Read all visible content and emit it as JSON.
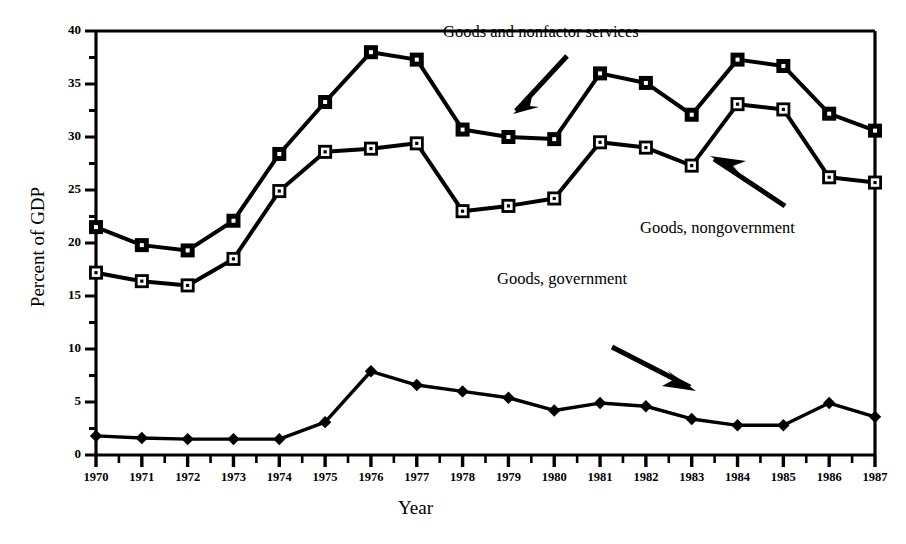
{
  "chart_data": {
    "type": "line",
    "title": "",
    "xlabel": "Year",
    "ylabel": "Percent of GDP",
    "xlim": [
      1970,
      1987
    ],
    "ylim": [
      0,
      40
    ],
    "yticks": [
      0,
      5,
      10,
      15,
      20,
      25,
      30,
      35,
      40
    ],
    "ytick_labels": [
      "0",
      "5",
      "10",
      "15",
      "20",
      "25",
      "30",
      "35",
      "40"
    ],
    "minor_y_interval": 2.5,
    "grid": false,
    "legend": "none",
    "categories": [
      1970,
      1971,
      1972,
      1973,
      1974,
      1975,
      1976,
      1977,
      1978,
      1979,
      1980,
      1981,
      1982,
      1983,
      1984,
      1985,
      1986,
      1987
    ],
    "xtick_labels": [
      "1970",
      "1971",
      "1972",
      "1973",
      "1974",
      "1975",
      "1976",
      "1977",
      "1978",
      "1979",
      "1980",
      "1981",
      "1982",
      "1983",
      "1984",
      "1985",
      "1986",
      "1987"
    ],
    "series": [
      {
        "name": "Goods and nonfactor services",
        "marker": "filled-square",
        "color": "#000000",
        "values": [
          21.5,
          19.8,
          19.3,
          22.1,
          28.4,
          33.3,
          38.0,
          37.3,
          30.7,
          30.0,
          29.8,
          36.0,
          35.1,
          32.1,
          37.3,
          36.7,
          32.2,
          30.6
        ]
      },
      {
        "name": "Goods, nongovernment",
        "marker": "open-square",
        "color": "#000000",
        "values": [
          17.2,
          16.4,
          16.0,
          18.5,
          24.9,
          28.6,
          28.9,
          29.4,
          23.0,
          23.5,
          24.2,
          29.5,
          29.0,
          27.3,
          33.1,
          32.6,
          26.2,
          25.7
        ]
      },
      {
        "name": "Goods, government",
        "marker": "filled-diamond",
        "color": "#000000",
        "values": [
          1.8,
          1.6,
          1.5,
          1.5,
          1.5,
          3.1,
          7.9,
          6.6,
          6.0,
          5.4,
          4.2,
          4.9,
          4.6,
          3.4,
          2.8,
          2.8,
          4.9,
          3.6
        ]
      }
    ],
    "annotations": [
      {
        "text": "Goods and nonfactor services",
        "target_series": "Goods and nonfactor services",
        "arrow": "down-left"
      },
      {
        "text": "Goods, nongovernment",
        "target_series": "Goods, nongovernment",
        "arrow": "up-left"
      },
      {
        "text": "Goods, government",
        "target_series": "Goods, government",
        "arrow": "down-right"
      }
    ]
  },
  "axes": {
    "ylabel": "Percent of GDP",
    "xlabel": "Year"
  }
}
